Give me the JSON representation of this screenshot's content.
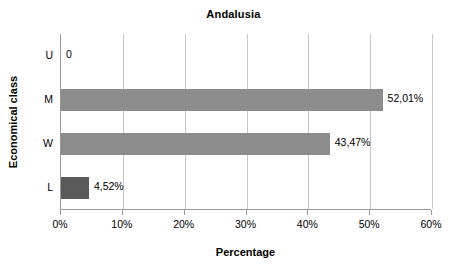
{
  "chart_data": {
    "type": "bar",
    "orientation": "horizontal",
    "title": "Andalusia",
    "xlabel": "Percentage",
    "ylabel": "Economical class",
    "categories": [
      "U",
      "M",
      "W",
      "L"
    ],
    "values": [
      0,
      52.01,
      43.47,
      4.52
    ],
    "data_labels": [
      "0",
      "52,01%",
      "43,47%",
      "4,52%"
    ],
    "xlim": [
      0,
      60
    ],
    "xticks": [
      0,
      10,
      20,
      30,
      40,
      50,
      60
    ],
    "xtick_labels": [
      "0%",
      "10%",
      "20%",
      "30%",
      "40%",
      "50%",
      "60%"
    ],
    "grid": true,
    "legend": "none",
    "bar_colors": [
      "#8c8c8c",
      "#8c8c8c",
      "#8c8c8c",
      "#595959"
    ],
    "gridline_color": "#c8c8c8",
    "axis_color": "#9a9a9a",
    "text_color": "#000000",
    "background": "#ffffff"
  }
}
